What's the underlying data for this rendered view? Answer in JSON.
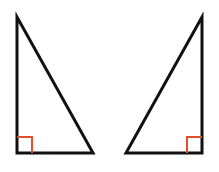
{
  "diagram": {
    "colors": {
      "stroke": "#111111",
      "right_angle_marker": "#e0502a",
      "background": "#ffffff"
    },
    "triangles": [
      {
        "id": "left",
        "right_angle_position": "bottom-left",
        "points": [
          [
            17,
            17
          ],
          [
            17,
            153
          ],
          [
            93,
            153
          ]
        ],
        "marker": [
          [
            17,
            137
          ],
          [
            32,
            137
          ],
          [
            32,
            153
          ]
        ]
      },
      {
        "id": "right",
        "right_angle_position": "bottom-right",
        "points": [
          [
            202,
            17
          ],
          [
            202,
            153
          ],
          [
            126,
            153
          ]
        ],
        "marker": [
          [
            202,
            137
          ],
          [
            187,
            137
          ],
          [
            187,
            153
          ]
        ]
      }
    ]
  }
}
